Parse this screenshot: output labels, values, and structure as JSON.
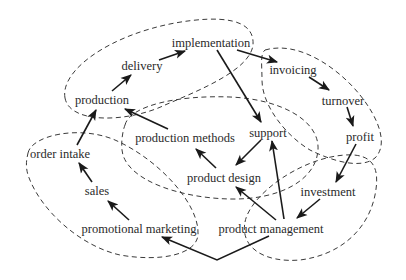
{
  "diagram": {
    "type": "cause-effect cycle diagram",
    "colors": {
      "text": "#2a2a2a",
      "edge": "#1a1a1a",
      "cluster": "#3a3a3a",
      "background": "#ffffff"
    },
    "nodes": {
      "implementation": "implementation",
      "delivery": "delivery",
      "production": "production",
      "invoicing": "invoicing",
      "turnover": "turnover",
      "profit": "profit",
      "support": "support",
      "production_methods": "production methods",
      "product_design": "product design",
      "order_intake": "order intake",
      "sales": "sales",
      "promotional_marketing": "promotional marketing",
      "investment": "investment",
      "product_management": "product management"
    },
    "edges": [
      [
        "production",
        "delivery"
      ],
      [
        "delivery",
        "implementation"
      ],
      [
        "implementation",
        "invoicing"
      ],
      [
        "implementation",
        "support"
      ],
      [
        "invoicing",
        "turnover"
      ],
      [
        "turnover",
        "profit"
      ],
      [
        "profit",
        "investment"
      ],
      [
        "investment",
        "product management"
      ],
      [
        "product management",
        "support"
      ],
      [
        "product management",
        "product design"
      ],
      [
        "support",
        "product design"
      ],
      [
        "product design",
        "production methods"
      ],
      [
        "production methods",
        "production"
      ],
      [
        "product management",
        "promotional marketing"
      ],
      [
        "promotional marketing",
        "sales"
      ],
      [
        "sales",
        "order intake"
      ],
      [
        "order intake",
        "production"
      ]
    ],
    "clusters": [
      {
        "name": "production-delivery-implementation"
      },
      {
        "name": "invoicing-turnover-profit"
      },
      {
        "name": "production-methods-support-product-design"
      },
      {
        "name": "order-intake-sales-promotional-marketing"
      },
      {
        "name": "investment-product-management"
      }
    ]
  }
}
